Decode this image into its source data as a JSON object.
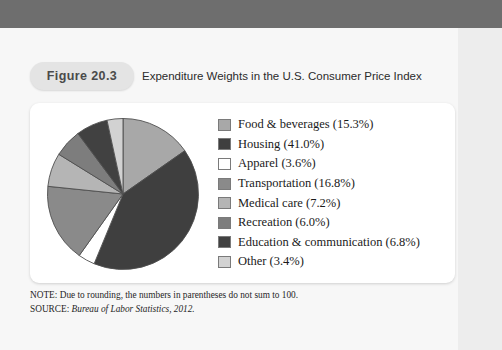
{
  "figure": {
    "badge": "Figure 20.3",
    "title": "Expenditure Weights in the U.S. Consumer Price Index"
  },
  "footnotes": {
    "note_prefix": "NOTE: ",
    "note_text": "Due to rounding, the numbers in parentheses do not sum to 100.",
    "source_prefix": "SOURCE: ",
    "source_text": "Bureau of Labor Statistics, 2012."
  },
  "colors": {
    "page_background": "#f7f7f7",
    "top_band": "#6e6e6e",
    "card_background": "#ffffff",
    "badge_background": "#e4e4e4",
    "slice_outline": "#4f4f4f"
  },
  "chart_data": {
    "type": "pie",
    "title": "Expenditure Weights in the U.S. Consumer Price Index",
    "unit": "percent",
    "start_angle_deg": 0,
    "direction": "clockwise",
    "legend_position": "right",
    "total": 100.1,
    "categories": [
      "Food & beverages",
      "Housing",
      "Apparel",
      "Transportation",
      "Medical care",
      "Recreation",
      "Education & communication",
      "Other"
    ],
    "values": [
      15.3,
      41.0,
      3.6,
      16.8,
      7.2,
      6.0,
      6.8,
      3.4
    ],
    "slices": [
      {
        "label": "Food & beverages (15.3%)",
        "name": "Food & beverages",
        "value": 15.3,
        "color": "#a8a8a8"
      },
      {
        "label": "Housing (41.0%)",
        "name": "Housing",
        "value": 41.0,
        "color": "#3f3f3f"
      },
      {
        "label": "Apparel (3.6%)",
        "name": "Apparel",
        "value": 3.6,
        "color": "#ffffff"
      },
      {
        "label": "Transportation (16.8%)",
        "name": "Transportation",
        "value": 16.8,
        "color": "#8a8a8a"
      },
      {
        "label": "Medical care (7.2%)",
        "name": "Medical care",
        "value": 7.2,
        "color": "#b5b5b5"
      },
      {
        "label": "Recreation (6.0%)",
        "name": "Recreation",
        "value": 6.0,
        "color": "#7d7d7d"
      },
      {
        "label": "Education & communication (6.8%)",
        "name": "Education & communication",
        "value": 6.8,
        "color": "#414141"
      },
      {
        "label": "Other (3.4%)",
        "name": "Other",
        "value": 3.4,
        "color": "#d2d2d2"
      }
    ]
  }
}
